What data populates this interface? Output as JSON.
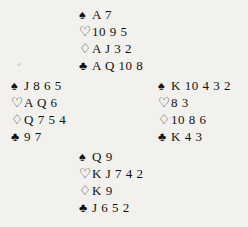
{
  "diagram": {
    "type": "bridge-deal",
    "suit_symbols": {
      "spade": "♠",
      "heart": "♡",
      "diamond": "♢",
      "club": "♣"
    },
    "hands": {
      "north": {
        "position": "North",
        "spades": "A 7",
        "hearts": "10 9 5",
        "diamonds": "A J 3 2",
        "clubs": "A Q 10 8"
      },
      "west": {
        "position": "West",
        "spades": "J 8 6 5",
        "hearts": "A Q 6",
        "diamonds": "Q 7 5 4",
        "clubs": "9 7"
      },
      "east": {
        "position": "East",
        "spades": "K 10 4 3 2",
        "hearts": "8 3",
        "diamonds": "10 8 6",
        "clubs": "K 4 3"
      },
      "south": {
        "position": "South",
        "spades": "Q 9",
        "hearts": "K J 7 4 2",
        "diamonds": "K 9",
        "clubs": "J 6 5 2"
      }
    }
  }
}
